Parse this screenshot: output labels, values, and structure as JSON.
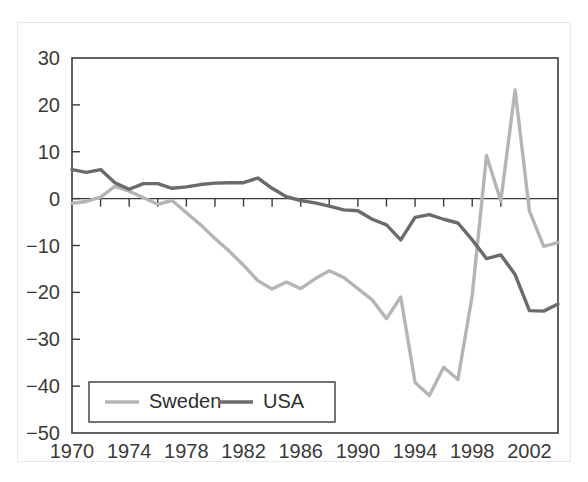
{
  "chart_data": {
    "type": "line",
    "title": "",
    "subtitle": "",
    "xlabel": "",
    "ylabel": "",
    "xlim": [
      1970,
      2004
    ],
    "ylim": [
      -50,
      30
    ],
    "grid": false,
    "legend_position": "bottom-left",
    "x_ticks": [
      1970,
      1974,
      1978,
      1982,
      1986,
      1990,
      1994,
      1998,
      2002
    ],
    "x_tick_labels": [
      "1970",
      "1974",
      "1978",
      "1982",
      "1986",
      "1990",
      "1994",
      "1998",
      "2002"
    ],
    "x_minor_ticks": [
      1972,
      1976,
      1980,
      1984,
      1988,
      1992,
      1996,
      2000,
      2004
    ],
    "y_ticks": [
      30,
      20,
      10,
      0,
      -10,
      -20,
      -30,
      -40,
      -50
    ],
    "y_tick_labels": [
      "30",
      "20",
      "10",
      "0",
      "−10",
      "−20",
      "−30",
      "−40",
      "−50"
    ],
    "x": [
      1970,
      1971,
      1972,
      1973,
      1974,
      1975,
      1976,
      1977,
      1978,
      1979,
      1980,
      1981,
      1982,
      1983,
      1984,
      1985,
      1986,
      1987,
      1988,
      1989,
      1990,
      1991,
      1992,
      1993,
      1994,
      1995,
      1996,
      1997,
      1998,
      1999,
      2000,
      2001,
      2002,
      2003,
      2004
    ],
    "series": [
      {
        "name": "Sweden",
        "color": "#b5b5b5",
        "values": [
          -1.0,
          -0.6,
          0.3,
          2.6,
          1.6,
          0.2,
          -1.2,
          -0.4,
          -3.0,
          -5.6,
          -8.5,
          -11.2,
          -14.2,
          -17.5,
          -19.3,
          -17.8,
          -19.2,
          -17.1,
          -15.4,
          -16.8,
          -19.2,
          -21.6,
          -25.6,
          -21.0,
          -39.2,
          -42.0,
          -36.0,
          -38.6,
          -20.6,
          9.2,
          -0.5,
          23.2,
          -2.6,
          -10.2,
          -9.4
        ]
      },
      {
        "name": "USA",
        "color": "#6b6b6b",
        "values": [
          6.2,
          5.6,
          6.2,
          3.4,
          2.0,
          3.2,
          3.2,
          2.2,
          2.5,
          3.0,
          3.3,
          3.4,
          3.4,
          4.4,
          2.2,
          0.4,
          -0.4,
          -0.9,
          -1.6,
          -2.4,
          -2.6,
          -4.4,
          -5.6,
          -8.8,
          -4.0,
          -3.4,
          -4.4,
          -5.2,
          -8.8,
          -12.8,
          -12.0,
          -16.2,
          -23.9,
          -24.0,
          -22.5
        ]
      }
    ]
  },
  "legend": {
    "entries": [
      {
        "label": "Sweden",
        "color": "#b5b5b5"
      },
      {
        "label": "USA",
        "color": "#6b6b6b"
      }
    ]
  }
}
